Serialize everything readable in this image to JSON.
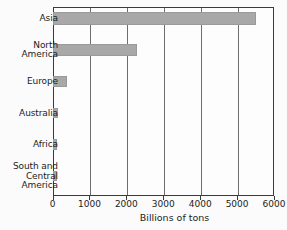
{
  "chart_data": {
    "type": "bar",
    "orientation": "horizontal",
    "title": "",
    "xlabel": "Billions of tons",
    "ylabel": "",
    "categories": [
      "Asia",
      "North\nAmerica",
      "Europe",
      "Australia",
      "Africa",
      "South and\nCentral\nAmerica"
    ],
    "values": [
      5500,
      2300,
      400,
      150,
      130,
      110
    ],
    "xlim": [
      0,
      6000
    ],
    "xticks": [
      0,
      1000,
      2000,
      3000,
      4000,
      5000,
      6000
    ],
    "xtick_labels": [
      "0",
      "1000",
      "2000",
      "3000",
      "4000",
      "5000",
      "6000"
    ],
    "grid": "vertical",
    "legend": null,
    "bar_color": "#a8a8a8",
    "axis_color": "#3a3a3a",
    "background_color": "#fbfbfb"
  }
}
